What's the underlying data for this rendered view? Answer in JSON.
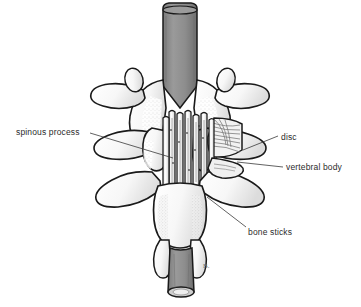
{
  "figure": {
    "background_color": "#ffffff",
    "ink_color": "#1a1a1a",
    "bone_fill_color": "#fdfdfd",
    "cut_bone_gray": "#8a8a8a",
    "shading_gray": "#bfbfbf",
    "leader_line_color": "#3a3a3a",
    "artist_mark": "B."
  },
  "labels": {
    "spinous_process": "spinous process",
    "disc": "disc",
    "vertebral_body": "vertebral body",
    "bone_sticks": "bone sticks"
  },
  "leaders": {
    "spinous_process": {
      "x1": 90,
      "y1": 133,
      "x2": 173,
      "y2": 158
    },
    "disc": {
      "x1": 278,
      "y1": 136,
      "x2": 243,
      "y2": 150
    },
    "vertebral_body": {
      "x1": 283,
      "y1": 167,
      "x2": 237,
      "y2": 162
    },
    "bone_sticks": {
      "x1": 246,
      "y1": 227,
      "x2": 207,
      "y2": 197
    }
  },
  "anatomy": {
    "vertebra_levels": 3,
    "bone_stick_count": 8,
    "structures": [
      "cut spinous process (top, gray)",
      "upper vertebra lamina and transverse processes",
      "middle vertebra lamina and transverse processes",
      "lower vertebra lamina and transverse processes",
      "intervertebral disc with annulus fibers",
      "stacked cortical bone graft sticks",
      "cut spinous process (bottom, gray)"
    ]
  }
}
